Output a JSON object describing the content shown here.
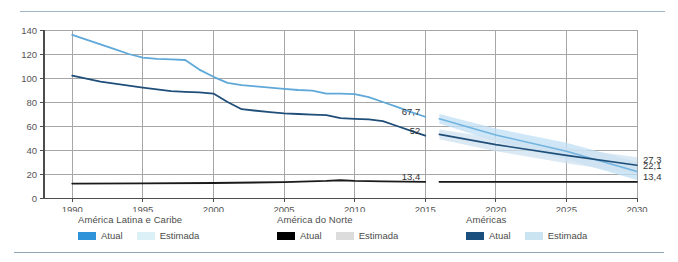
{
  "chart_data": {
    "type": "line",
    "title": "",
    "subtitle": "",
    "xlabel": "",
    "ylabel": "",
    "xlim": [
      1988,
      2030
    ],
    "ylim": [
      0,
      140
    ],
    "xticks": [
      "1990",
      "1995",
      "2000",
      "2005",
      "2010",
      "2015",
      "2020",
      "2025",
      "2030"
    ],
    "yticks": [
      "0",
      "20",
      "40",
      "60",
      "80",
      "100",
      "120",
      "140"
    ],
    "grid": true,
    "legend_position": "below",
    "series": [
      {
        "name": "América Latina e Caribe",
        "kind": "actual",
        "color": "#5fa8d8",
        "x": [
          1990,
          1991,
          1992,
          1993,
          1994,
          1995,
          1996,
          1997,
          1998,
          1999,
          2000,
          2001,
          2002,
          2003,
          2004,
          2005,
          2006,
          2007,
          2008,
          2009,
          2010,
          2011,
          2012,
          2013,
          2014,
          2015
        ],
        "values": [
          136,
          132,
          128,
          124,
          120,
          117,
          116,
          115.5,
          115,
          107,
          101,
          96,
          94,
          93,
          92,
          91,
          90,
          89.5,
          87,
          87,
          86.5,
          84,
          80,
          76,
          71.5,
          67.7
        ]
      },
      {
        "name": "América Latina e Caribe",
        "kind": "estimated",
        "color": "#72b4e0",
        "band_color": "#bfdff4",
        "x": [
          2016,
          2020,
          2025,
          2030
        ],
        "values": [
          66,
          52.5,
          39,
          22.1
        ],
        "band_low": [
          62,
          47,
          32,
          15
        ],
        "band_high": [
          70,
          58,
          46,
          30
        ]
      },
      {
        "name": "América do Norte",
        "kind": "actual",
        "color": "#1a1a1a",
        "x": [
          1990,
          1995,
          2000,
          2005,
          2008,
          2009,
          2010,
          2012,
          2015
        ],
        "values": [
          12,
          12.2,
          12.5,
          13.2,
          14.2,
          14.8,
          14.2,
          13.8,
          13.4
        ]
      },
      {
        "name": "América do Norte",
        "kind": "estimated",
        "color": "#1a1a1a",
        "band_color": "#d8d8d8",
        "x": [
          2016,
          2030
        ],
        "values": [
          13.4,
          13.4
        ],
        "band_low": [
          12.6,
          12.6
        ],
        "band_high": [
          14.2,
          14.2
        ]
      },
      {
        "name": "Américas",
        "kind": "actual",
        "color": "#1f4e79",
        "x": [
          1990,
          1992,
          1995,
          1997,
          1998,
          1999,
          2000,
          2001,
          2002,
          2004,
          2005,
          2006,
          2007,
          2008,
          2009,
          2010,
          2011,
          2012,
          2013,
          2014,
          2015
        ],
        "values": [
          102,
          97,
          92,
          89,
          88.5,
          88,
          87,
          80,
          74,
          71.5,
          70.5,
          70,
          69.5,
          69,
          66.5,
          66,
          65.5,
          64,
          60,
          56,
          52
        ]
      },
      {
        "name": "Américas",
        "kind": "estimated",
        "color": "#1f4e79",
        "band_color": "#cfe2f0",
        "x": [
          2016,
          2020,
          2025,
          2030
        ],
        "values": [
          53,
          44.5,
          35.5,
          27.3
        ],
        "band_low": [
          49,
          39,
          29,
          20
        ],
        "band_high": [
          57,
          50,
          42,
          34
        ]
      }
    ],
    "annotations": [
      {
        "text": "67,7",
        "x": 2015,
        "y": 67.7,
        "anchor": "left"
      },
      {
        "text": "52",
        "x": 2015,
        "y": 52,
        "anchor": "left"
      },
      {
        "text": "13,4",
        "x": 2015,
        "y": 13.4,
        "anchor": "left"
      },
      {
        "text": "27,3",
        "x": 2030,
        "y": 27.3,
        "anchor": "right"
      },
      {
        "text": "22,1",
        "x": 2030,
        "y": 22.1,
        "anchor": "right"
      },
      {
        "text": "13,4",
        "x": 2030,
        "y": 13.4,
        "anchor": "right"
      }
    ]
  },
  "axis": {
    "y_labels": [
      "140",
      "120",
      "100",
      "80",
      "60",
      "40",
      "20",
      "0"
    ],
    "x_labels": [
      "1990",
      "1995",
      "2000",
      "2005",
      "2010",
      "2015",
      "2020",
      "2025",
      "2030"
    ]
  },
  "value_labels": {
    "lac_2015": "67,7",
    "americas_2015": "52",
    "northamerica_2015": "13,4",
    "americas_2030": "27,3",
    "lac_2030": "22,1",
    "northamerica_2030": "13,4"
  },
  "legend": {
    "groups": [
      {
        "title": "América Latina e Caribe",
        "items": [
          {
            "label": "Atual",
            "color": "#2e93d9"
          },
          {
            "label": "Estimada",
            "color": "#dcf0f7"
          }
        ]
      },
      {
        "title": "América do Norte",
        "items": [
          {
            "label": "Atual",
            "color": "#000000"
          },
          {
            "label": "Estimada",
            "color": "#dcdcdc"
          }
        ]
      },
      {
        "title": "Américas",
        "items": [
          {
            "label": "Atual",
            "color": "#1b4f7d"
          },
          {
            "label": "Estimada",
            "color": "#cbe4f2"
          }
        ]
      }
    ]
  },
  "colors": {
    "grid": "#a6a6a6",
    "axis": "#4d4d4d",
    "rule": "#9fb5c4",
    "background": "#ffffff"
  }
}
